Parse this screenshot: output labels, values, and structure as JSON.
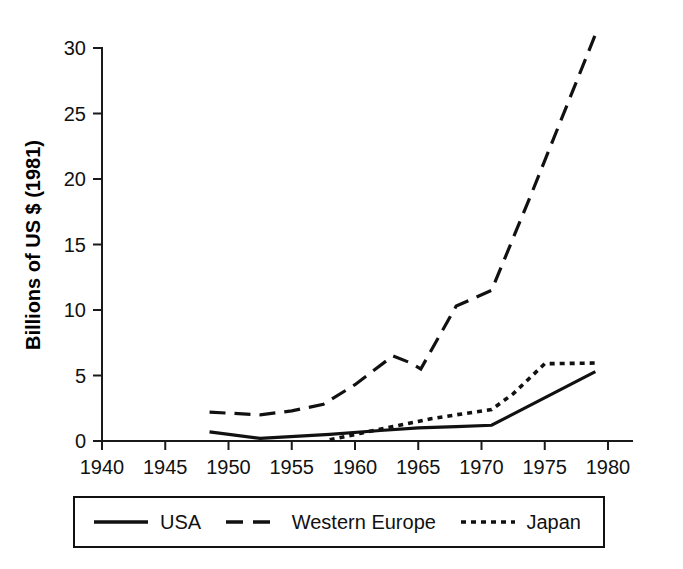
{
  "chart_data": {
    "type": "line",
    "title": "",
    "xlabel": "",
    "ylabel": "Billions of US $ (1981)",
    "xlim": [
      1940,
      1982
    ],
    "ylim": [
      0,
      31.5
    ],
    "xticks": [
      1940,
      1945,
      1950,
      1955,
      1960,
      1965,
      1970,
      1975,
      1980
    ],
    "yticks": [
      0,
      5,
      10,
      15,
      20,
      25,
      30
    ],
    "xtick_labels": [
      "1940",
      "1945",
      "1950",
      "1955",
      "1960",
      "1965",
      "1970",
      "1975",
      "1980"
    ],
    "ytick_labels": [
      "0",
      "5",
      "10",
      "15",
      "20",
      "25",
      "30"
    ],
    "grid": false,
    "legend_position": "bottom",
    "series": [
      {
        "name": "USA",
        "style": "solid",
        "color": "#111111",
        "x": [
          1948.5,
          1952.5,
          1958.0,
          1962.0,
          1965.0,
          1968.0,
          1970.8,
          1979.0
        ],
        "values": [
          0.7,
          0.2,
          0.5,
          0.8,
          1.0,
          1.1,
          1.2,
          5.3
        ]
      },
      {
        "name": "Western Europe",
        "style": "dashed",
        "color": "#111111",
        "x": [
          1948.5,
          1952.5,
          1955.0,
          1957.5,
          1960.0,
          1963.0,
          1964.3,
          1965.2,
          1968.0,
          1970.8,
          1974.0,
          1979.2
        ],
        "values": [
          2.2,
          2.0,
          2.3,
          2.8,
          4.3,
          6.5,
          6.0,
          5.5,
          10.3,
          11.5,
          19.0,
          31.5
        ]
      },
      {
        "name": "Japan",
        "style": "dotted",
        "color": "#111111",
        "x": [
          1958.0,
          1960.5,
          1963.0,
          1966.0,
          1968.0,
          1970.8,
          1972.5,
          1975.0,
          1979.0
        ],
        "values": [
          0.1,
          0.6,
          1.1,
          1.7,
          2.0,
          2.4,
          3.6,
          5.9,
          5.95
        ]
      }
    ]
  },
  "legend": {
    "entries": [
      {
        "label": "USA",
        "style": "solid"
      },
      {
        "label": "Western Europe",
        "style": "dashed"
      },
      {
        "label": "Japan",
        "style": "dotted"
      }
    ]
  }
}
